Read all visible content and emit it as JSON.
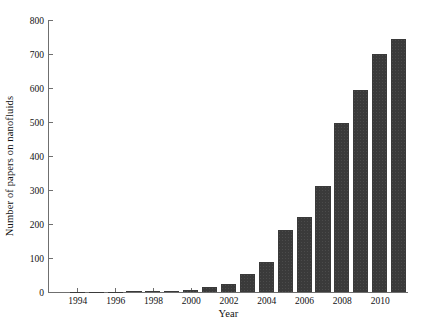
{
  "chart_data": {
    "type": "bar",
    "title": "",
    "subtitle": "",
    "xlabel": "Year",
    "ylabel": "Number of papers on nanofluids",
    "categories": [
      1993,
      1994,
      1995,
      1996,
      1997,
      1998,
      1999,
      2000,
      2001,
      2002,
      2003,
      2004,
      2005,
      2006,
      2007,
      2008,
      2009,
      2010,
      2011
    ],
    "values": [
      0,
      1,
      1,
      1,
      2,
      3,
      3,
      7,
      14,
      24,
      53,
      88,
      183,
      220,
      312,
      497,
      595,
      700,
      745
    ],
    "series": [
      {
        "name": "Number of papers on nanofluids",
        "values": [
          0,
          1,
          1,
          1,
          2,
          3,
          3,
          7,
          14,
          24,
          53,
          88,
          183,
          220,
          312,
          497,
          595,
          700,
          745
        ]
      }
    ],
    "ylim": [
      0,
      800
    ],
    "xlim": [
      1992.5,
      2011.5
    ],
    "yticks": [
      0,
      100,
      200,
      300,
      400,
      500,
      600,
      700,
      800
    ],
    "ytick_labels": [
      "0",
      "100",
      "200",
      "300",
      "400",
      "500",
      "600",
      "700",
      "800"
    ],
    "xticks": [
      1994,
      1996,
      1998,
      2000,
      2002,
      2004,
      2006,
      2008,
      2010
    ],
    "xtick_labels": [
      "1994",
      "1996",
      "1998",
      "2000",
      "2002",
      "2004",
      "2006",
      "2008",
      "2010"
    ],
    "grid": false,
    "legend": false,
    "legend_position": "none",
    "bar_color": "#3a3a3a",
    "axis_color": "#6f6f6f",
    "background_color": "#ffffff",
    "annotations": []
  }
}
